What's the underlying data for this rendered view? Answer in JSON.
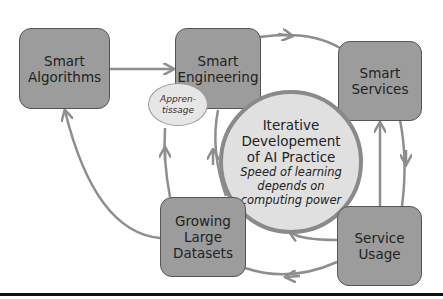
{
  "diagram": {
    "nodes": {
      "smart_algorithms": {
        "line1": "Smart",
        "line2": "Algorithms"
      },
      "smart_engineering": {
        "line1": "Smart",
        "line2": "Engineering"
      },
      "smart_services": {
        "line1": "Smart",
        "line2": "Services"
      },
      "growing_large_datasets": {
        "line1": "Growing",
        "line2": "Large",
        "line3": "Datasets"
      },
      "service_usage": {
        "line1": "Service",
        "line2": "Usage"
      }
    },
    "center": {
      "title_line1": "Iterative",
      "title_line2": "Developement",
      "title_line3": "of AI Practice",
      "subtitle_line1": "Speed of learning",
      "subtitle_line2": "depends on",
      "subtitle_line3": "computing power"
    },
    "annotation": {
      "line1": "Appren-",
      "line2": "tissage"
    },
    "edges": [
      {
        "from": "Smart Algorithms",
        "to": "Smart Engineering"
      },
      {
        "from": "Smart Engineering",
        "to": "Smart Services"
      },
      {
        "from": "Smart Services",
        "to": "Service Usage"
      },
      {
        "from": "Service Usage",
        "to": "Smart Services"
      },
      {
        "from": "Service Usage",
        "to": "Growing Large Datasets"
      },
      {
        "from": "Service Usage",
        "to": "Iterative Developement of AI Practice"
      },
      {
        "from": "Growing Large Datasets",
        "to": "Smart Algorithms"
      },
      {
        "from": "Growing Large Datasets",
        "to": "Smart Engineering"
      },
      {
        "from": "Iterative Developement of AI Practice",
        "to": "Smart Engineering"
      }
    ],
    "colors": {
      "box_fill": "#9c9c9c",
      "box_border": "#555555",
      "circle_fill": "#e0e0e0",
      "arrow": "#8e8e8e"
    }
  }
}
